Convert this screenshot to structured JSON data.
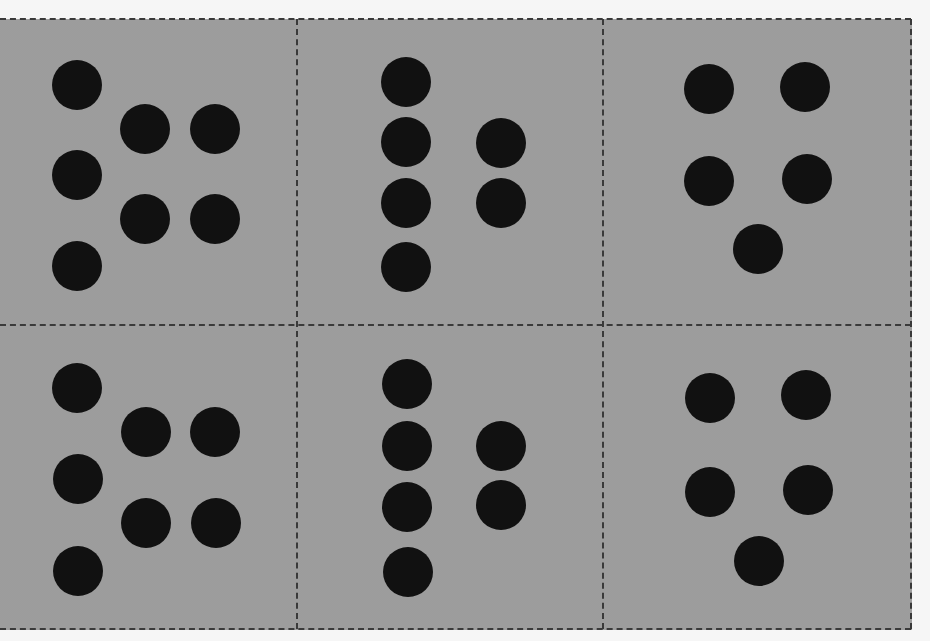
{
  "figure": {
    "colors": {
      "background": "#f6f6f6",
      "card_fill": "#e2e2e2",
      "halftone": "#9a9a9a",
      "dot": "#111111",
      "dashed_line": "#3a3a3a"
    },
    "sheet": {
      "x": 0,
      "y": 19,
      "width": 912,
      "height": 611
    },
    "lines": {
      "top_y": 19,
      "bottom_y": 629,
      "middle_y": 325,
      "right_x": 911,
      "vertical_x": [
        297,
        603
      ]
    },
    "dot_radius": 25,
    "panels": [
      {
        "id": "panel-1",
        "row": 0,
        "col": 0,
        "dot_count": 7,
        "dots": [
          [
            77,
            85
          ],
          [
            145,
            129
          ],
          [
            215,
            129
          ],
          [
            77,
            175
          ],
          [
            145,
            219
          ],
          [
            215,
            219
          ],
          [
            77,
            266
          ]
        ]
      },
      {
        "id": "panel-2",
        "row": 0,
        "col": 1,
        "dot_count": 6,
        "dots": [
          [
            406,
            82
          ],
          [
            406,
            142
          ],
          [
            501,
            143
          ],
          [
            406,
            203
          ],
          [
            501,
            203
          ],
          [
            406,
            267
          ]
        ]
      },
      {
        "id": "panel-3",
        "row": 0,
        "col": 2,
        "dot_count": 5,
        "dots": [
          [
            709,
            89
          ],
          [
            805,
            87
          ],
          [
            709,
            181
          ],
          [
            807,
            179
          ],
          [
            758,
            249
          ]
        ]
      },
      {
        "id": "panel-4",
        "row": 1,
        "col": 0,
        "dot_count": 7,
        "dots": [
          [
            77,
            388
          ],
          [
            146,
            432
          ],
          [
            215,
            432
          ],
          [
            78,
            479
          ],
          [
            146,
            523
          ],
          [
            216,
            523
          ],
          [
            78,
            571
          ]
        ]
      },
      {
        "id": "panel-5",
        "row": 1,
        "col": 1,
        "dot_count": 6,
        "dots": [
          [
            407,
            384
          ],
          [
            407,
            446
          ],
          [
            501,
            446
          ],
          [
            407,
            507
          ],
          [
            501,
            505
          ],
          [
            408,
            572
          ]
        ]
      },
      {
        "id": "panel-6",
        "row": 1,
        "col": 2,
        "dot_count": 5,
        "dots": [
          [
            710,
            398
          ],
          [
            806,
            395
          ],
          [
            710,
            492
          ],
          [
            808,
            490
          ],
          [
            759,
            561
          ]
        ]
      }
    ]
  }
}
